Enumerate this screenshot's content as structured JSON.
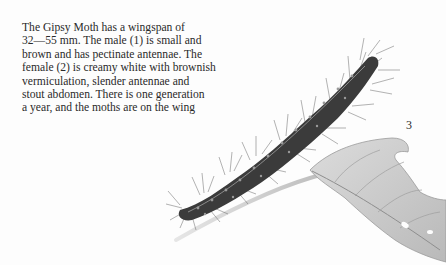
{
  "text": {
    "lines": [
      "The Gipsy Moth has a wingspan of",
      "32—55 mm. The male (1) is small and",
      "brown and has pectinate antennae. The",
      "female (2) is creamy white with brownish",
      "vermiculation, slender antennae and",
      "stout abdomen. There is one generation",
      "a year, and the moths are on the wing"
    ]
  },
  "figure": {
    "number": "3",
    "colors": {
      "body": "#3b3b3b",
      "hairs": "#6a6a6a",
      "leaf": "#c9c9c9",
      "leaf_vein": "#8e8e8e",
      "stem": "#bdbdbd"
    }
  }
}
